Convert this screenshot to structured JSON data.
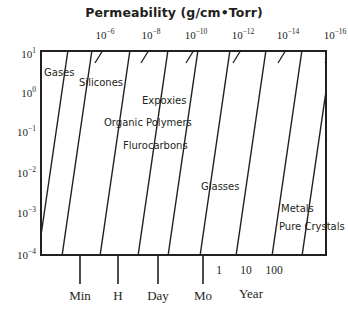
{
  "chart_data": {
    "type": "line",
    "title": "Permeability (g/cm•Torr)",
    "xlabel": "",
    "ylabel": "",
    "grid": false,
    "legend_position": "inline-annotations",
    "top_axis": {
      "name": "permeability",
      "tick_labels": [
        "10⁻⁶",
        "10⁻⁸",
        "10⁻¹⁰",
        "10⁻¹²",
        "10⁻¹⁴",
        "10⁻¹⁶"
      ],
      "tick_mantissas": [
        "10",
        "10",
        "10",
        "10",
        "10",
        "10"
      ],
      "tick_exponents": [
        "-6",
        "-8",
        "-10",
        "-12",
        "-14",
        "-16"
      ],
      "tick_values": [
        1e-06,
        1e-08,
        1e-10,
        1e-12,
        1e-14,
        1e-16
      ],
      "tick_x_px": [
        62,
        108,
        153,
        200,
        245,
        292
      ]
    },
    "y_axis": {
      "name": "thickness",
      "tick_labels": [
        "10¹",
        "10⁰",
        "10⁻¹",
        "10⁻²",
        "10⁻³",
        "10⁻⁴"
      ],
      "tick_mantissas": [
        "10",
        "10",
        "10",
        "10",
        "10",
        "10"
      ],
      "tick_exponents": [
        "1",
        "0",
        "-1",
        "-2",
        "-3",
        "-4"
      ],
      "tick_values": [
        10,
        1,
        0.1,
        0.01,
        0.001,
        0.0001
      ],
      "tick_y_px": [
        53,
        92,
        131,
        172,
        212,
        254
      ]
    },
    "bottom_axis": {
      "name": "time",
      "tick_labels": [
        "Min",
        "H",
        "Day",
        "Mo"
      ],
      "tick_x_px": [
        80,
        118,
        158,
        203
      ],
      "year_numbers": [
        "1",
        "10",
        "100"
      ],
      "year_number_x_px": [
        219,
        246,
        274
      ],
      "year_word": "Year",
      "year_word_x_px": 251
    },
    "bands": [
      {
        "label": "Gases",
        "x_px": 44,
        "y_px": 67
      },
      {
        "label": "Silicones",
        "x_px": 79,
        "y_px": 77
      },
      {
        "label": "Expoxies",
        "x_px": 142,
        "y_px": 95
      },
      {
        "label": "Organic Polymers",
        "x_px": 104,
        "y_px": 117
      },
      {
        "label": "Flurocarbons",
        "x_px": 123,
        "y_px": 140
      },
      {
        "label": "Glasses",
        "x_px": 201,
        "y_px": 181
      },
      {
        "label": "Metals",
        "x_px": 281,
        "y_px": 203
      },
      {
        "label": "Pure Crystals",
        "x_px": 279,
        "y_px": 221
      }
    ],
    "series": [
      {
        "name": "gases-boundary-1",
        "x1_px": -2,
        "y1_px": 206,
        "x2_px": 28,
        "y2_px": 0
      },
      {
        "name": "gases-boundary-2",
        "x1_px": 22,
        "y1_px": 206,
        "x2_px": 52,
        "y2_px": 0
      },
      {
        "name": "silicones-boundary",
        "x1_px": 60,
        "y1_px": 206,
        "x2_px": 90,
        "y2_px": 0
      },
      {
        "name": "organic-boundary-1",
        "x1_px": 98,
        "y1_px": 206,
        "x2_px": 128,
        "y2_px": 0
      },
      {
        "name": "organic-boundary-2",
        "x1_px": 128,
        "y1_px": 206,
        "x2_px": 158,
        "y2_px": 0
      },
      {
        "name": "flurocarbons-boundary",
        "x1_px": 160,
        "y1_px": 206,
        "x2_px": 190,
        "y2_px": 0
      },
      {
        "name": "glasses-boundary-1",
        "x1_px": 196,
        "y1_px": 206,
        "x2_px": 226,
        "y2_px": 0
      },
      {
        "name": "glasses-boundary-2",
        "x1_px": 232,
        "y1_px": 206,
        "x2_px": 262,
        "y2_px": 0
      },
      {
        "name": "crystals-boundary",
        "x1_px": 262,
        "y1_px": 206,
        "x2_px": 292,
        "y2_px": 0
      }
    ],
    "colors": {
      "ink": "#231f20",
      "background": "#ffffff"
    }
  }
}
